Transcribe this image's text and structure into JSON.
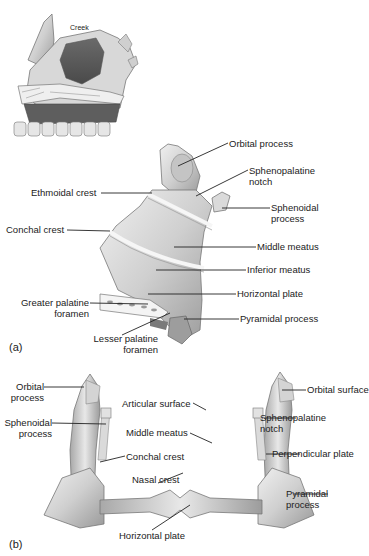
{
  "figure": {
    "inset": {
      "label": "Creek"
    },
    "panel_a": {
      "tag": "(a)",
      "labels": {
        "orbital_process": "Orbital process",
        "sphenopalatine_notch_1": "Sphenopalatine",
        "sphenopalatine_notch_2": "notch",
        "sphenoidal_process_1": "Sphenoidal",
        "sphenoidal_process_2": "process",
        "ethmoidal_crest": "Ethmoidal crest",
        "conchal_crest": "Conchal crest",
        "middle_meatus": "Middle meatus",
        "inferior_meatus": "Inferior meatus",
        "horizontal_plate": "Horizontal plate",
        "greater_palatine_1": "Greater palatine",
        "greater_palatine_2": "foramen",
        "pyramidal_process": "Pyramidal process",
        "lesser_palatine_1": "Lesser palatine",
        "lesser_palatine_2": "foramen"
      }
    },
    "panel_b": {
      "tag": "(b)",
      "labels": {
        "orbital_process_1": "Orbital",
        "orbital_process_2": "process",
        "sphenoidal_process_1": "Sphenoidal",
        "sphenoidal_process_2": "process",
        "articular_surface": "Articular surface",
        "middle_meatus": "Middle meatus",
        "conchal_crest": "Conchal crest",
        "nasal_crest": "Nasal crest",
        "horizontal_plate": "Horizontal plate",
        "orbital_surface": "Orbital surface",
        "sphenopalatine_notch_1": "Sphenopalatine",
        "sphenopalatine_notch_2": "notch",
        "perpendicular_plate": "Perpendicular plate",
        "pyramidal_process_1": "Pyramidal",
        "pyramidal_process_2": "process"
      }
    },
    "colors": {
      "bone_light": "#e4e4e4",
      "bone_mid": "#bdbdbd",
      "bone_dark": "#8a8a8a",
      "leader_line": "#222222",
      "text": "#222222"
    }
  }
}
